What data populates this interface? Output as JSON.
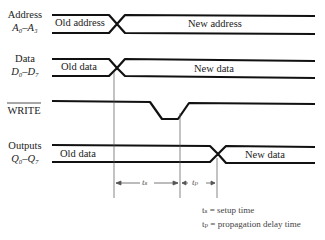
{
  "signals": [
    {
      "name": "Address",
      "sub": "A₀–A₃",
      "old": "Old address",
      "new": "New address"
    },
    {
      "name": "Data",
      "sub": "D₀–D₇",
      "old": "Old data",
      "new": "New data"
    },
    {
      "name": "WRITE",
      "active_low": true
    },
    {
      "name": "Outputs",
      "sub": "Q₀–Q₇",
      "old": "Old data",
      "new": "New data"
    }
  ],
  "intervals": {
    "ts": "tₛ",
    "tp": "tₚ"
  },
  "legend": {
    "ts": "tₛ = setup time",
    "tp": "tₚ = propagation delay time"
  }
}
